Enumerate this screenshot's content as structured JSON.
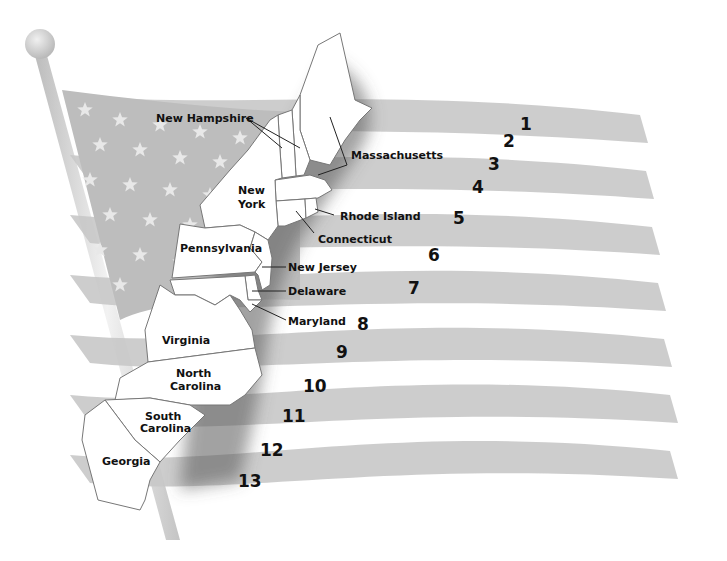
{
  "colors": {
    "flag_stripe": "#c8c8c8",
    "flag_canton": "#bdbdbd",
    "star": "#e6e6e6",
    "state_fill": "#ffffff",
    "state_border": "#777777",
    "label_text": "#111111",
    "pole": "#d4d4d4"
  },
  "states": [
    {
      "id": "new-hampshire",
      "label": "New Hampshire"
    },
    {
      "id": "massachusetts",
      "label": "Massachusetts"
    },
    {
      "id": "new-york",
      "label_line1": "New",
      "label_line2": "York"
    },
    {
      "id": "rhode-island",
      "label": "Rhode Island"
    },
    {
      "id": "connecticut",
      "label": "Connecticut"
    },
    {
      "id": "pennsylvania",
      "label": "Pennsylvania"
    },
    {
      "id": "new-jersey",
      "label": "New Jersey"
    },
    {
      "id": "delaware",
      "label": "Delaware"
    },
    {
      "id": "maryland",
      "label": "Maryland"
    },
    {
      "id": "virginia",
      "label": "Virginia"
    },
    {
      "id": "north-carolina",
      "label_line1": "North",
      "label_line2": "Carolina"
    },
    {
      "id": "south-carolina",
      "label_line1": "South",
      "label_line2": "Carolina"
    },
    {
      "id": "georgia",
      "label": "Georgia"
    }
  ],
  "stripe_numbers": [
    "1",
    "2",
    "3",
    "4",
    "5",
    "6",
    "7",
    "8",
    "9",
    "10",
    "11",
    "12",
    "13"
  ]
}
